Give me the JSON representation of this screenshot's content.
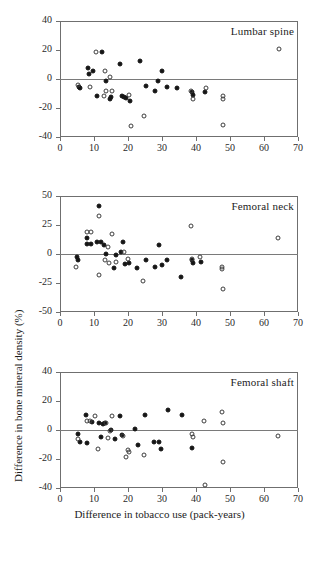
{
  "figure": {
    "x_axis_title": "Difference in tobacco use (pack-years)",
    "y_axis_title": "Difference in bone mineral density (%)"
  },
  "chart_data": [
    {
      "type": "scatter",
      "title": "Lumbar spine",
      "xlabel": "Difference in tobacco use (pack-years)",
      "ylabel": "Difference in bone mineral density (%)",
      "xlim": [
        0,
        70
      ],
      "ylim": [
        -40,
        40
      ],
      "xticks": [
        0,
        10,
        20,
        30,
        40,
        50,
        60,
        70
      ],
      "yticks": [
        40,
        20,
        0,
        -20,
        -40
      ],
      "grid": false,
      "legend": "none",
      "reference_line_y": 0,
      "series": [
        {
          "name": "filled",
          "marker": "filled-circle",
          "points": [
            [
              5.6,
              -5.5
            ],
            [
              5.8,
              -6.0
            ],
            [
              8.2,
              7.3
            ],
            [
              8.4,
              3.2
            ],
            [
              9.6,
              5.8
            ],
            [
              11.0,
              -12.0
            ],
            [
              12.4,
              18.8
            ],
            [
              13.6,
              -1.2
            ],
            [
              14.8,
              -13.5
            ],
            [
              15.0,
              -12.5
            ],
            [
              17.6,
              10.5
            ],
            [
              18.2,
              -12.0
            ],
            [
              18.8,
              -12.5
            ],
            [
              19.4,
              -13.0
            ],
            [
              20.6,
              -15.2
            ],
            [
              23.6,
              12.5
            ],
            [
              25.2,
              -4.5
            ],
            [
              28.0,
              -8.2
            ],
            [
              28.8,
              -1.2
            ],
            [
              30.0,
              5.2
            ],
            [
              31.6,
              -5.2
            ],
            [
              34.4,
              -6.0
            ],
            [
              38.8,
              -8.8
            ],
            [
              39.0,
              -11.2
            ],
            [
              42.6,
              -9.2
            ]
          ]
        },
        {
          "name": "open",
          "marker": "open-circle",
          "points": [
            [
              5.2,
              -3.8
            ],
            [
              8.8,
              -5.5
            ],
            [
              10.6,
              18.6
            ],
            [
              13.2,
              5.2
            ],
            [
              13.4,
              -8.0
            ],
            [
              14.6,
              1.5
            ],
            [
              15.4,
              -8.2
            ],
            [
              12.8,
              -11.8
            ],
            [
              20.4,
              -11.2
            ],
            [
              20.8,
              -32.5
            ],
            [
              24.6,
              -25.2
            ],
            [
              38.6,
              -8.5
            ],
            [
              39.0,
              -13.5
            ],
            [
              42.8,
              -6.5
            ],
            [
              47.8,
              -12.0
            ],
            [
              47.8,
              -13.8
            ],
            [
              48.0,
              -31.5
            ],
            [
              64.4,
              21.0
            ]
          ]
        }
      ]
    },
    {
      "type": "scatter",
      "title": "Femoral neck",
      "xlabel": "Difference in tobacco use (pack-years)",
      "ylabel": "Difference in bone mineral density (%)",
      "xlim": [
        0,
        70
      ],
      "ylim": [
        -50,
        50
      ],
      "xticks": [
        0,
        10,
        20,
        30,
        40,
        50,
        60,
        70
      ],
      "yticks": [
        50,
        25,
        0,
        -25,
        -50
      ],
      "grid": false,
      "legend": "none",
      "reference_line_y": 0,
      "series": [
        {
          "name": "filled",
          "marker": "filled-circle",
          "points": [
            [
              5.0,
              -3.0
            ],
            [
              5.4,
              -5.5
            ],
            [
              7.8,
              13.5
            ],
            [
              8.0,
              9.0
            ],
            [
              9.2,
              8.5
            ],
            [
              11.0,
              10.5
            ],
            [
              11.4,
              41.5
            ],
            [
              12.0,
              10.0
            ],
            [
              13.0,
              8.0
            ],
            [
              13.6,
              0.0
            ],
            [
              15.8,
              -12.0
            ],
            [
              16.4,
              -0.5
            ],
            [
              18.0,
              1.5
            ],
            [
              18.6,
              10.5
            ],
            [
              19.2,
              -9.0
            ],
            [
              20.2,
              -7.5
            ],
            [
              22.6,
              -12.0
            ],
            [
              25.4,
              -5.0
            ],
            [
              27.8,
              -11.5
            ],
            [
              29.2,
              8.0
            ],
            [
              30.0,
              -9.5
            ],
            [
              31.4,
              -5.5
            ],
            [
              35.6,
              -20.0
            ],
            [
              38.8,
              -5.5
            ],
            [
              39.0,
              -7.5
            ],
            [
              41.6,
              -6.5
            ]
          ]
        },
        {
          "name": "open",
          "marker": "open-circle",
          "points": [
            [
              4.8,
              -11.0
            ],
            [
              7.8,
              19.0
            ],
            [
              9.2,
              19.0
            ],
            [
              11.4,
              33.0
            ],
            [
              11.6,
              -18.0
            ],
            [
              13.2,
              -5.5
            ],
            [
              14.0,
              6.0
            ],
            [
              14.4,
              -7.5
            ],
            [
              15.2,
              17.5
            ],
            [
              16.6,
              -7.0
            ],
            [
              18.8,
              1.5
            ],
            [
              20.0,
              -4.5
            ],
            [
              24.4,
              -23.0
            ],
            [
              38.6,
              24.5
            ],
            [
              38.8,
              -4.5
            ],
            [
              41.2,
              -2.5
            ],
            [
              47.6,
              -11.0
            ],
            [
              47.6,
              -13.0
            ],
            [
              47.8,
              -30.0
            ],
            [
              64.0,
              14.0
            ]
          ]
        }
      ]
    },
    {
      "type": "scatter",
      "title": "Femoral shaft",
      "xlabel": "Difference in tobacco use (pack-years)",
      "ylabel": "Difference in bone mineral density (%)",
      "xlim": [
        0,
        70
      ],
      "ylim": [
        -40,
        40
      ],
      "xticks": [
        0,
        10,
        20,
        30,
        40,
        50,
        60,
        70
      ],
      "yticks": [
        40,
        20,
        0,
        -20,
        -40
      ],
      "grid": false,
      "legend": "none",
      "reference_line_y": 0,
      "series": [
        {
          "name": "filled",
          "marker": "filled-circle",
          "points": [
            [
              5.4,
              -2.5
            ],
            [
              6.0,
              -8.0
            ],
            [
              7.6,
              10.5
            ],
            [
              7.8,
              -9.0
            ],
            [
              9.4,
              5.5
            ],
            [
              11.4,
              5.0
            ],
            [
              12.0,
              -5.0
            ],
            [
              12.6,
              4.0
            ],
            [
              13.2,
              4.5
            ],
            [
              15.0,
              -0.2
            ],
            [
              16.2,
              -6.0
            ],
            [
              17.6,
              9.5
            ],
            [
              18.2,
              -3.5
            ],
            [
              22.0,
              1.0
            ],
            [
              23.0,
              -10.5
            ],
            [
              25.0,
              10.5
            ],
            [
              27.6,
              -8.0
            ],
            [
              29.2,
              -8.5
            ],
            [
              29.6,
              -13.0
            ],
            [
              31.8,
              14.0
            ],
            [
              36.0,
              10.5
            ],
            [
              38.8,
              -12.5
            ]
          ]
        },
        {
          "name": "open",
          "marker": "open-circle",
          "points": [
            [
              5.2,
              -6.0
            ],
            [
              7.8,
              6.0
            ],
            [
              8.8,
              6.5
            ],
            [
              10.2,
              9.5
            ],
            [
              11.2,
              -13.0
            ],
            [
              13.6,
              4.5
            ],
            [
              14.2,
              -5.5
            ],
            [
              15.4,
              9.5
            ],
            [
              14.8,
              -0.5
            ],
            [
              18.4,
              -4.0
            ],
            [
              19.4,
              -18.5
            ],
            [
              20.4,
              -15.0
            ],
            [
              20.0,
              -13.5
            ],
            [
              24.8,
              -17.0
            ],
            [
              38.8,
              -2.5
            ],
            [
              39.0,
              -4.5
            ],
            [
              42.4,
              6.0
            ],
            [
              42.6,
              -38.0
            ],
            [
              47.6,
              12.5
            ],
            [
              47.8,
              5.0
            ],
            [
              47.8,
              -22.0
            ],
            [
              64.2,
              -4.0
            ]
          ]
        }
      ]
    }
  ]
}
